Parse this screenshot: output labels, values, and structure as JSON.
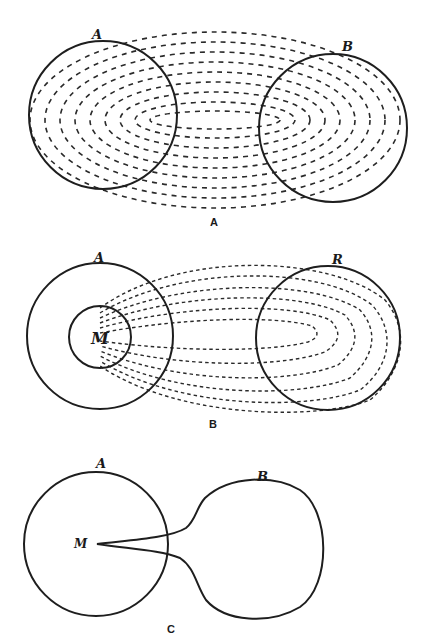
{
  "figures": [
    {
      "id": "A",
      "caption": "A",
      "labels": {
        "left": "A",
        "right": "B"
      },
      "description": "Two circles A and B enclosed by nested dashed elliptical field lines"
    },
    {
      "id": "B",
      "caption": "B",
      "labels": {
        "left": "A",
        "right": "R",
        "inner": "M"
      },
      "description": "Circle A containing inner circle M; dashed loops extend from M into circle R"
    },
    {
      "id": "C",
      "caption": "C",
      "labels": {
        "left": "A",
        "right": "B",
        "point": "M"
      },
      "description": "Circle A with point M connected by a narrow neck to bulb B"
    }
  ],
  "colors": {
    "ink": "#1e1e1e",
    "background": "#ffffff"
  }
}
